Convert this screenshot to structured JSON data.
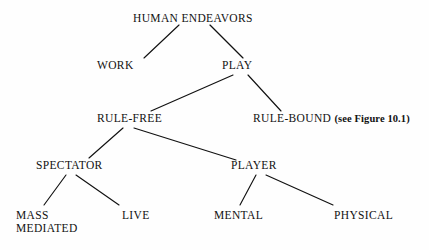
{
  "figure": {
    "kind": "hierarchy-tree",
    "title_node": "HUMAN ENDEAVORS",
    "background_color": "#fefefe",
    "line_color": "#111111",
    "text_color": "#111111"
  },
  "nodes": {
    "root": {
      "label": "HUMAN ENDEAVORS"
    },
    "work": {
      "label": "WORK"
    },
    "play": {
      "label": "PLAY"
    },
    "rule_free": {
      "label": "RULE-FREE"
    },
    "rule_bound": {
      "label": "RULE-BOUND",
      "annotation": "(see Figure 10.1)"
    },
    "spectator": {
      "label": "SPECTATOR"
    },
    "player": {
      "label": "PLAYER"
    },
    "mass_mediated": {
      "label_line1": "MASS",
      "label_line2": "MEDIATED"
    },
    "live": {
      "label": "LIVE"
    },
    "mental": {
      "label": "MENTAL"
    },
    "physical": {
      "label": "PHYSICAL"
    }
  },
  "edges": [
    {
      "from": "root",
      "to": "work"
    },
    {
      "from": "root",
      "to": "play"
    },
    {
      "from": "play",
      "to": "rule_free"
    },
    {
      "from": "play",
      "to": "rule_bound"
    },
    {
      "from": "rule_free",
      "to": "spectator"
    },
    {
      "from": "rule_free",
      "to": "player"
    },
    {
      "from": "spectator",
      "to": "mass_mediated"
    },
    {
      "from": "spectator",
      "to": "live"
    },
    {
      "from": "player",
      "to": "mental"
    },
    {
      "from": "player",
      "to": "physical"
    }
  ]
}
